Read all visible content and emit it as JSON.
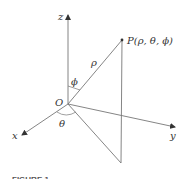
{
  "diagram": {
    "type": "spherical-coordinates",
    "colors": {
      "line": "#7a7a7a",
      "axis": "#555555",
      "text": "#333333",
      "background": "#ffffff"
    },
    "axes": {
      "z_label": "z",
      "y_label": "y",
      "x_label": "x"
    },
    "origin_label": "O",
    "point_label": "P(ρ, θ, ϕ)",
    "rho_label": "ρ",
    "phi_label": "ϕ",
    "theta_label": "θ",
    "caption": "FIGURE 1"
  }
}
